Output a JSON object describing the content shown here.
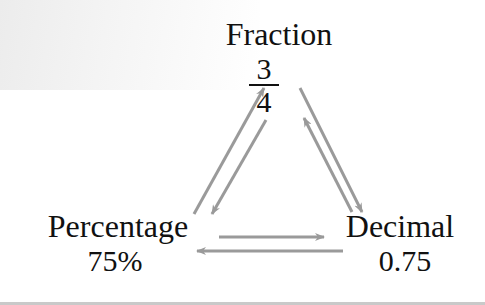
{
  "diagram": {
    "nodes": {
      "fraction": {
        "label": "Fraction",
        "numerator": "3",
        "denominator": "4"
      },
      "percentage": {
        "label": "Percentage",
        "value": "75%"
      },
      "decimal": {
        "label": "Decimal",
        "value": "0.75"
      }
    },
    "edges": [
      {
        "from": "percentage",
        "to": "fraction"
      },
      {
        "from": "fraction",
        "to": "percentage"
      },
      {
        "from": "fraction",
        "to": "decimal"
      },
      {
        "from": "decimal",
        "to": "fraction"
      },
      {
        "from": "percentage",
        "to": "decimal"
      },
      {
        "from": "decimal",
        "to": "percentage"
      }
    ],
    "colors": {
      "arrow": "#9a9a9a",
      "text": "#111111"
    }
  }
}
